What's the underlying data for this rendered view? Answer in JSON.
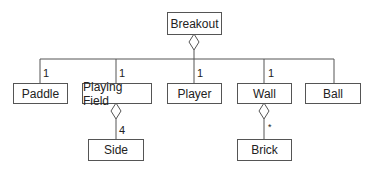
{
  "diagram": {
    "type": "uml-class-aggregation",
    "root": {
      "label": "Breakout"
    },
    "children": [
      {
        "label": "Paddle",
        "multiplicity": "1"
      },
      {
        "label": "Playing Field",
        "multiplicity": "1"
      },
      {
        "label": "Player",
        "multiplicity": "1"
      },
      {
        "label": "Wall",
        "multiplicity": "1"
      },
      {
        "label": "Ball",
        "multiplicity": ""
      }
    ],
    "grandchildren": [
      {
        "parent": "Playing Field",
        "label": "Side",
        "multiplicity": "4"
      },
      {
        "parent": "Wall",
        "label": "Brick",
        "multiplicity": "*"
      }
    ]
  }
}
